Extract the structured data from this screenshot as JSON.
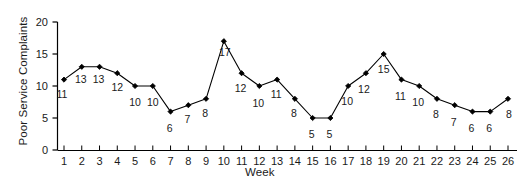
{
  "chart_data": {
    "type": "line",
    "title": "",
    "xlabel": "Week",
    "ylabel": "Poor Service Complaints",
    "x": [
      1,
      2,
      3,
      4,
      5,
      6,
      7,
      8,
      9,
      10,
      11,
      12,
      13,
      14,
      15,
      16,
      17,
      18,
      19,
      20,
      21,
      22,
      23,
      24,
      25,
      26
    ],
    "categories": [
      "1",
      "2",
      "3",
      "4",
      "5",
      "6",
      "7",
      "8",
      "9",
      "10",
      "11",
      "12",
      "13",
      "14",
      "15",
      "16",
      "17",
      "18",
      "19",
      "20",
      "21",
      "22",
      "23",
      "24",
      "25",
      "26"
    ],
    "values": [
      11,
      13,
      13,
      12,
      10,
      10,
      6,
      7,
      8,
      17,
      12,
      10,
      11,
      8,
      5,
      5,
      10,
      12,
      15,
      11,
      10,
      8,
      7,
      6,
      6,
      8
    ],
    "point_labels": [
      "11",
      "13",
      "13",
      "12",
      "10",
      "10",
      "6",
      "7",
      "8",
      "17",
      "12",
      "10",
      "11",
      "8",
      "5",
      "5",
      "10",
      "12",
      "15",
      "11",
      "10",
      "8",
      "7",
      "6",
      "6",
      "8"
    ],
    "xlim": [
      0.5,
      26.6
    ],
    "ylim": [
      0,
      20
    ],
    "ytick_values": [
      0,
      5,
      10,
      15,
      20
    ],
    "ytick_labels": [
      "0",
      "5",
      "10",
      "15",
      "20"
    ],
    "xtick_labels": [
      "1",
      "2",
      "3",
      "4",
      "5",
      "6",
      "7",
      "8",
      "9",
      "10",
      "11",
      "12",
      "13",
      "14",
      "15",
      "16",
      "17",
      "18",
      "19",
      "20",
      "21",
      "22",
      "23",
      "24",
      "25",
      "26"
    ],
    "grid": false,
    "legend": null,
    "marker": "filled-diamond",
    "line_color": "#000000",
    "marker_color": "#000000",
    "axis_color": "#000000",
    "text_color": "#1a1a1a",
    "background_color": "#ffffff",
    "label_offsets": [
      {
        "dx": -2,
        "dy": 18
      },
      {
        "dx": -1,
        "dy": 16
      },
      {
        "dx": -1,
        "dy": 16
      },
      {
        "dx": 0,
        "dy": 18
      },
      {
        "dx": 0,
        "dy": 20
      },
      {
        "dx": 0,
        "dy": 20
      },
      {
        "dx": -1,
        "dy": 20
      },
      {
        "dx": -1,
        "dy": 18
      },
      {
        "dx": -1,
        "dy": 18
      },
      {
        "dx": 1,
        "dy": 15
      },
      {
        "dx": -1,
        "dy": 19
      },
      {
        "dx": -1,
        "dy": 21
      },
      {
        "dx": -1,
        "dy": 18
      },
      {
        "dx": -1,
        "dy": 18
      },
      {
        "dx": -1,
        "dy": 20
      },
      {
        "dx": -1,
        "dy": 20
      },
      {
        "dx": -1,
        "dy": 19
      },
      {
        "dx": -2,
        "dy": 20
      },
      {
        "dx": 0,
        "dy": 19
      },
      {
        "dx": -1,
        "dy": 20
      },
      {
        "dx": -1,
        "dy": 20
      },
      {
        "dx": -1,
        "dy": 19
      },
      {
        "dx": -1,
        "dy": 21
      },
      {
        "dx": -1,
        "dy": 20
      },
      {
        "dx": -1,
        "dy": 20
      },
      {
        "dx": 1,
        "dy": 19
      }
    ]
  }
}
